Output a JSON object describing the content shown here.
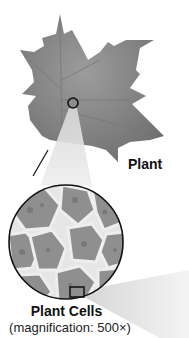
{
  "diagram": {
    "leaf": {
      "label": "Plant",
      "marker": "circle-marker"
    },
    "cells": {
      "title": "Plant Cells",
      "magnification_text": "(magnification: 500×)",
      "magnification_value": 500,
      "marker": "rectangle-marker"
    },
    "colors": {
      "leaf": "#8a8a8a",
      "beam": "#d9d9d9",
      "outline": "#111111",
      "cell_wall": "#e8e8e8",
      "cell_fill": "#9a9a9a"
    }
  }
}
